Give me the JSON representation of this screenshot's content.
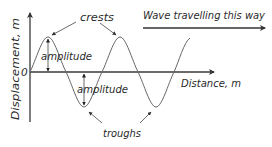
{
  "diagram": {
    "direction_label": "Wave travelling this way",
    "axes": {
      "y_label": "Displacement, m",
      "x_label": "Distance, m",
      "origin_label": "0"
    },
    "labels": {
      "crests": "crests",
      "troughs": "troughs",
      "amplitude_upper": "amplitude",
      "amplitude_lower": "amplitude"
    },
    "colors": {
      "axis": "#3a3a3a",
      "wave": "#666666",
      "text": "#2a2a2a"
    }
  }
}
